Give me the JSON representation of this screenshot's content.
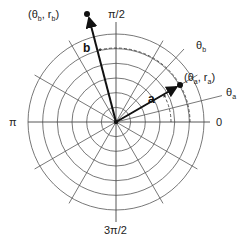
{
  "diagram": {
    "type": "polar-coordinate-grid",
    "center": [
      116,
      122
    ],
    "outer_radius": 88,
    "ring_count": 6,
    "radial_spacing_deg": 30,
    "axis_labels": {
      "zero": "0",
      "half_pi": "π/2",
      "pi": "π",
      "three_half_pi": "3π/2"
    },
    "angle_lines": [
      {
        "label": "θ",
        "sub": "a",
        "angle_deg": 14
      },
      {
        "label": "θ",
        "sub": "b",
        "angle_deg": 47
      }
    ],
    "vectors": [
      {
        "name": "a",
        "label": "a",
        "angle_deg": 30,
        "length": 71,
        "point_label": "(θa, ra)",
        "point_text": {
          "open": "(θ",
          "s1": "a",
          "mid": ", r",
          "s2": "a",
          "close": ")"
        }
      },
      {
        "name": "b",
        "label": "b",
        "angle_deg": 104,
        "length": 110,
        "point_label": "(θb, rb)",
        "point_text": {
          "open": "(θ",
          "s1": "b",
          "mid": ", r",
          "s2": "b",
          "close": ")"
        }
      }
    ],
    "colors": {
      "grid": "#555555",
      "vector": "#111111",
      "background": "#ffffff"
    }
  }
}
